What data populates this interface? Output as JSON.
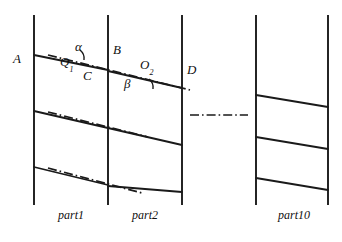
{
  "figure": {
    "type": "technical-line-diagram",
    "background_color": "#ffffff",
    "line_color": "#1a1a1a",
    "labels": {
      "point_a": "A",
      "point_b": "B",
      "point_c": "C",
      "point_d": "D",
      "node_q1_base": "Q",
      "node_q1_sub": "1",
      "node_o2_base": "O",
      "node_o2_sub": "2",
      "angle_alpha": "α",
      "angle_beta": "β"
    },
    "part_captions": {
      "part1": "part1",
      "part2": "part2",
      "part10": "part10"
    },
    "vertical_rails": [
      {
        "name": "rail-left-part1",
        "x": 34,
        "y_top": 15,
        "y_bottom": 205
      },
      {
        "name": "rail-right-part1",
        "x": 108,
        "y_top": 15,
        "y_bottom": 205
      },
      {
        "name": "rail-right-part2",
        "x": 182,
        "y_top": 15,
        "y_bottom": 205
      },
      {
        "name": "rail-left-part10",
        "x": 256,
        "y_top": 15,
        "y_bottom": 205
      },
      {
        "name": "rail-right-part10",
        "x": 328,
        "y_top": 15,
        "y_bottom": 205
      }
    ],
    "solid_slanted_lines": [
      {
        "name": "slant-part1-top",
        "x1": 34,
        "y1": 55,
        "x2": 108,
        "y2": 70
      },
      {
        "name": "slant-part1-middle",
        "x1": 34,
        "y1": 111,
        "x2": 108,
        "y2": 128
      },
      {
        "name": "slant-part1-bottom",
        "x1": 34,
        "y1": 167,
        "x2": 108,
        "y2": 185
      },
      {
        "name": "slant-part2-top",
        "x1": 108,
        "y1": 71,
        "x2": 182,
        "y2": 88
      },
      {
        "name": "slant-part2-middle",
        "x1": 108,
        "y1": 128,
        "x2": 182,
        "y2": 145
      },
      {
        "name": "slant-part2-bottom",
        "x1": 108,
        "y1": 186,
        "x2": 182,
        "y2": 192
      },
      {
        "name": "slant-part10-top",
        "x1": 256,
        "y1": 95,
        "x2": 328,
        "y2": 107
      },
      {
        "name": "slant-part10-middle",
        "x1": 256,
        "y1": 137,
        "x2": 328,
        "y2": 149
      },
      {
        "name": "slant-part10-bottom",
        "x1": 256,
        "y1": 178,
        "x2": 328,
        "y2": 190
      }
    ],
    "dashdot_lines": [
      {
        "name": "dashdot-chord-top",
        "x1": 48,
        "y1": 55,
        "x2": 190,
        "y2": 90
      },
      {
        "name": "dashdot-chord-middle",
        "x1": 48,
        "y1": 112,
        "x2": 148,
        "y2": 137
      },
      {
        "name": "dashdot-chord-bottom",
        "x1": 48,
        "y1": 168,
        "x2": 142,
        "y2": 193
      },
      {
        "name": "dashdot-ellipsis",
        "x1": 190,
        "y1": 115,
        "x2": 248,
        "y2": 115
      }
    ],
    "angle_arcs": [
      {
        "name": "angle-arc-alpha",
        "cx": 73,
        "cy": 58,
        "r": 11
      },
      {
        "name": "angle-arc-beta",
        "cx": 142,
        "cy": 87,
        "r": 11
      }
    ],
    "label_positions": {
      "point_a": {
        "x": 13,
        "y": 59
      },
      "point_b": {
        "x": 113,
        "y": 50
      },
      "point_c": {
        "x": 83,
        "y": 76
      },
      "point_d": {
        "x": 187,
        "y": 70
      },
      "node_q1": {
        "x": 60,
        "y": 62
      },
      "node_o2": {
        "x": 140,
        "y": 65
      },
      "angle_alpha": {
        "x": 75,
        "y": 47
      },
      "angle_beta": {
        "x": 124,
        "y": 84
      },
      "part1": {
        "x": 58,
        "y": 215
      },
      "part2": {
        "x": 132,
        "y": 215
      },
      "part10": {
        "x": 278,
        "y": 215
      }
    }
  }
}
